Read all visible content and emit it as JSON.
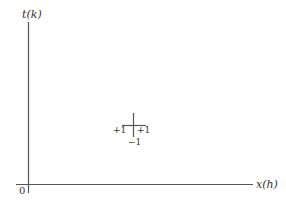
{
  "diagram": {
    "y_axis_label": "t(k)",
    "x_axis_label": "x(h)",
    "origin_label": "0",
    "cross": {
      "left_label": "+1",
      "right_label": "+1",
      "bottom_label": "−1"
    },
    "colors": {
      "line": "#555555",
      "text": "#333333"
    }
  }
}
